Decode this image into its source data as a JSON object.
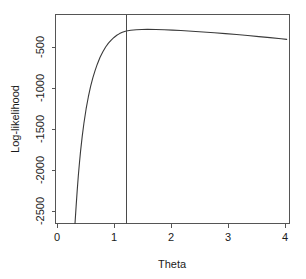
{
  "chart_data": {
    "type": "line",
    "title": "",
    "xlabel": "Theta",
    "ylabel": "Log-likelihood",
    "xlim": [
      -0.05,
      4.15
    ],
    "ylim": [
      -2620,
      -180
    ],
    "xticks": [
      0,
      1,
      2,
      3,
      4
    ],
    "xticklabels": [
      "0",
      "1",
      "2",
      "3",
      "4"
    ],
    "yticks": [
      -500,
      -1000,
      -1500,
      -2000,
      -2500
    ],
    "yticklabels": [
      "-500",
      "-1000",
      "-1500",
      "-2000",
      "-2500"
    ],
    "grid": false,
    "legend": null,
    "series": [
      {
        "name": "log-likelihood",
        "color": "#3a3a3a",
        "x": [
          0.3,
          0.32,
          0.34,
          0.36,
          0.38,
          0.4,
          0.43,
          0.46,
          0.5,
          0.54,
          0.58,
          0.62,
          0.66,
          0.7,
          0.75,
          0.8,
          0.85,
          0.9,
          0.95,
          1.0,
          1.05,
          1.1,
          1.15,
          1.22,
          1.3,
          1.4,
          1.5,
          1.6,
          1.75,
          1.9,
          2.05,
          2.2,
          2.4,
          2.6,
          2.8,
          3.0,
          3.2,
          3.4,
          3.6,
          3.8,
          4.0,
          4.1
        ],
        "y": [
          -2620,
          -2420,
          -2230,
          -2060,
          -1910,
          -1775,
          -1600,
          -1450,
          -1280,
          -1140,
          -1020,
          -920,
          -835,
          -760,
          -680,
          -615,
          -560,
          -515,
          -478,
          -448,
          -423,
          -403,
          -388,
          -373,
          -364,
          -358,
          -355,
          -354,
          -355,
          -358,
          -362,
          -367,
          -375,
          -384,
          -393,
          -403,
          -414,
          -426,
          -438,
          -450,
          -463,
          -470
        ]
      }
    ],
    "annotations": [
      {
        "type": "vline",
        "name": "mle-reference-line",
        "x": 1.22,
        "color": "#4a4a4a"
      }
    ]
  },
  "axis": {
    "x_title": "Theta",
    "y_title": "Log-likelihood"
  }
}
